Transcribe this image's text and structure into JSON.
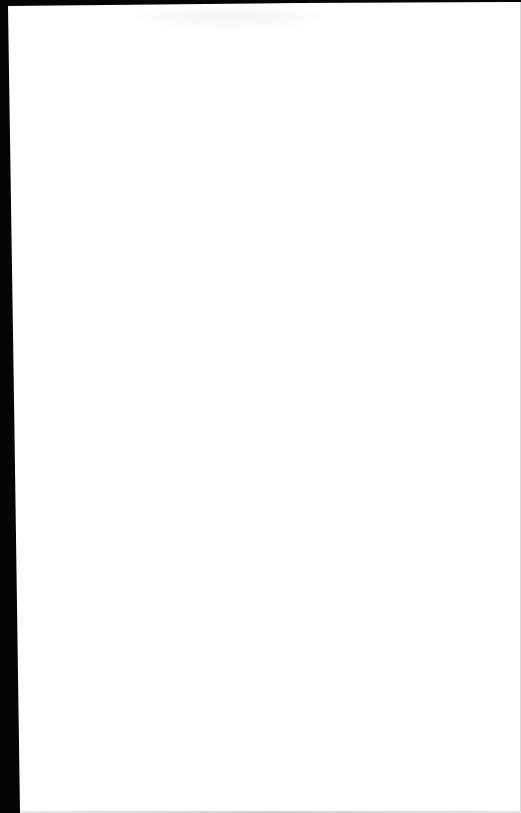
{
  "document": {
    "type": "blank-scanned-page",
    "text_content": [],
    "colors": {
      "paper": "#ffffff",
      "background": "#050505"
    }
  }
}
